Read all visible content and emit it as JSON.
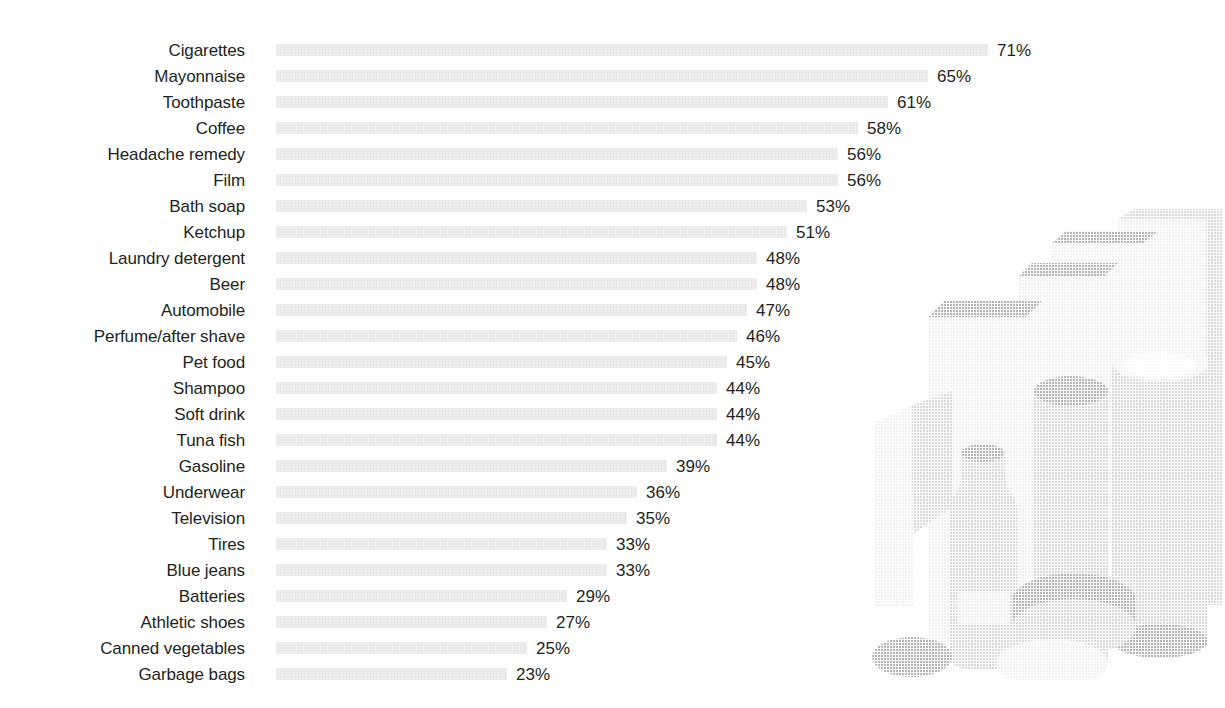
{
  "chart_data": {
    "type": "bar",
    "orientation": "horizontal",
    "title": "",
    "subtitle": "",
    "xlabel": "",
    "ylabel": "",
    "grid": false,
    "legend": null,
    "axis_visible": false,
    "value_suffix": "%",
    "xlim": [
      0,
      71
    ],
    "bar_color": "#e9e9e9",
    "label_color": "#231f20",
    "categories": [
      "Cigarettes",
      "Mayonnaise",
      "Toothpaste",
      "Coffee",
      "Headache remedy",
      "Film",
      "Bath soap",
      "Ketchup",
      "Laundry detergent",
      "Beer",
      "Automobile",
      "Perfume/after shave",
      "Pet food",
      "Shampoo",
      "Soft drink",
      "Tuna fish",
      "Gasoline",
      "Underwear",
      "Television",
      "Tires",
      "Blue jeans",
      "Batteries",
      "Athletic shoes",
      "Canned vegetables",
      "Garbage bags"
    ],
    "values": [
      71,
      65,
      61,
      58,
      56,
      56,
      53,
      51,
      48,
      48,
      47,
      46,
      45,
      44,
      44,
      44,
      39,
      36,
      35,
      33,
      33,
      29,
      27,
      25,
      23
    ],
    "value_labels": [
      "71%",
      "65%",
      "61%",
      "58%",
      "56%",
      "56%",
      "53%",
      "51%",
      "48%",
      "48%",
      "47%",
      "46%",
      "45%",
      "44%",
      "44%",
      "44%",
      "39%",
      "36%",
      "35%",
      "33%",
      "33%",
      "29%",
      "27%",
      "25%",
      "23%"
    ]
  },
  "illustration": {
    "name": "consumer-packaged-goods-illustration",
    "description": "Faded halftone grayscale illustration of stacked grocery packages: cartons, boxes, jars, a bottle and round lids",
    "fill": "#ededed",
    "shade": "#dcdcdc",
    "deep_shade": "#cfcfcf"
  }
}
